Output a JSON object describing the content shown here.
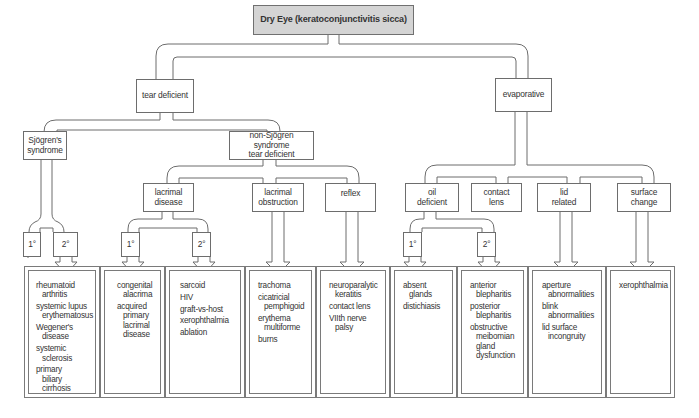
{
  "title": "Dry Eye (keratoconjunctivitis sicca)",
  "colors": {
    "root_fill": "#d4d4d4",
    "line": "#6d6d6d",
    "background": "#ffffff",
    "text": "#333333"
  },
  "level1": {
    "tear_deficient": "tear deficient",
    "evaporative": "evaporative"
  },
  "level2": {
    "sjogren": [
      "Sjögren's",
      "syndrome"
    ],
    "non_sjogren": [
      "non-Sjögren syndrome",
      "tear deficient"
    ]
  },
  "level3": {
    "lacrimal_disease": [
      "lacrimal",
      "disease"
    ],
    "lacrimal_obstruction": [
      "lacrimal",
      "obstruction"
    ],
    "reflex": [
      "reflex"
    ],
    "oil_deficient": [
      "oil",
      "deficient"
    ],
    "contact_lens": [
      "contact",
      "lens"
    ],
    "lid_related": [
      "lid",
      "related"
    ],
    "surface_change": [
      "surface",
      "change"
    ]
  },
  "degree_labels": {
    "primary": "1°",
    "secondary": "2°"
  },
  "panels": [
    {
      "id": "sjogren",
      "items": [
        [
          "rheumatoid",
          "arthritis"
        ],
        [
          "systemic lupus",
          "erythematosus"
        ],
        [
          "Wegener's",
          "disease"
        ],
        [
          "systemic",
          "sclerosis"
        ],
        [
          "primary",
          "biliary cirrhosis"
        ]
      ]
    },
    {
      "id": "lacrimal-primary",
      "items": [
        [
          "congenital",
          "alacrima"
        ],
        [
          "acquired",
          "primary"
        ],
        [
          "",
          "lacrimal"
        ],
        [
          "",
          "disease"
        ]
      ]
    },
    {
      "id": "lacrimal-secondary",
      "items": [
        [
          "sarcoid"
        ],
        [
          "HIV"
        ],
        [
          "graft-vs-host"
        ],
        [
          "xerophthalmia"
        ],
        [
          "ablation"
        ]
      ]
    },
    {
      "id": "lacrimal-obstruction",
      "items": [
        [
          "trachoma"
        ],
        [
          "cicatricial",
          "pemphigoid"
        ],
        [
          "erythema",
          "multiforme"
        ],
        [
          "burns"
        ]
      ]
    },
    {
      "id": "reflex",
      "items": [
        [
          "neuroparalytic",
          "keratitis"
        ],
        [
          "contact lens"
        ],
        [
          "VIIth nerve",
          "palsy"
        ]
      ]
    },
    {
      "id": "oil-primary",
      "items": [
        [
          "absent",
          "glands"
        ],
        [
          "distichiasis"
        ]
      ]
    },
    {
      "id": "oil-secondary",
      "items": [
        [
          "anterior",
          "blepharitis"
        ],
        [
          "posterior",
          "blepharitis"
        ],
        [
          "obstructive",
          "meibomian"
        ],
        [
          "",
          "gland"
        ],
        [
          "",
          "dysfunction"
        ]
      ]
    },
    {
      "id": "lid-related",
      "items": [
        [
          "aperture",
          "abnormalities"
        ],
        [
          "blink",
          "abnormalities"
        ],
        [
          "lid surface",
          "incongruity"
        ]
      ]
    },
    {
      "id": "surface-change",
      "items": [
        [
          "xerophthalmia"
        ]
      ]
    }
  ]
}
